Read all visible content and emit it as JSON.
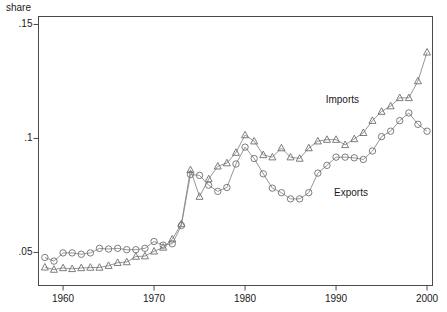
{
  "chart_data": {
    "type": "line",
    "title": "",
    "xlabel": "",
    "ylabel": "share",
    "xlim": [
      1957.3,
      2000.6
    ],
    "ylim": [
      0.0355,
      0.1535
    ],
    "grid": false,
    "legend_position": "inline-annotations",
    "xticks": [
      1960,
      1970,
      1980,
      1990,
      2000
    ],
    "xtick_labels": [
      "1960",
      "1970",
      "1980",
      "1990",
      "2000"
    ],
    "yticks": [
      0.05,
      0.1,
      0.15
    ],
    "ytick_labels": [
      ".05",
      ".1",
      ".15"
    ],
    "x": [
      1958,
      1959,
      1960,
      1961,
      1962,
      1963,
      1964,
      1965,
      1966,
      1967,
      1968,
      1969,
      1970,
      1971,
      1972,
      1973,
      1974,
      1975,
      1976,
      1977,
      1978,
      1979,
      1980,
      1981,
      1982,
      1983,
      1984,
      1985,
      1986,
      1987,
      1988,
      1989,
      1990,
      1991,
      1992,
      1993,
      1994,
      1995,
      1996,
      1997,
      1998,
      1999,
      2000
    ],
    "series": [
      {
        "name": "Imports",
        "marker": "triangle",
        "values": [
          0.0435,
          0.0425,
          0.0432,
          0.0428,
          0.0432,
          0.0434,
          0.0434,
          0.0442,
          0.0455,
          0.0458,
          0.0482,
          0.0484,
          0.0505,
          0.0522,
          0.0558,
          0.0625,
          0.0862,
          0.0745,
          0.0822,
          0.0878,
          0.0892,
          0.0938,
          0.1015,
          0.0988,
          0.0928,
          0.0918,
          0.0958,
          0.0918,
          0.0912,
          0.0958,
          0.0988,
          0.0995,
          0.0995,
          0.0972,
          0.0998,
          0.1025,
          0.1078,
          0.1118,
          0.1142,
          0.1178,
          0.1178,
          0.1252,
          0.1378
        ]
      },
      {
        "name": "Exports",
        "marker": "circle",
        "values": [
          0.0478,
          0.0462,
          0.0498,
          0.0498,
          0.0492,
          0.0498,
          0.0518,
          0.0515,
          0.0518,
          0.0512,
          0.0512,
          0.0518,
          0.0548,
          0.0532,
          0.0538,
          0.0618,
          0.0842,
          0.0838,
          0.0795,
          0.0768,
          0.0785,
          0.0888,
          0.0962,
          0.0912,
          0.0845,
          0.0782,
          0.0762,
          0.0735,
          0.0735,
          0.0762,
          0.0848,
          0.0882,
          0.0918,
          0.0918,
          0.0915,
          0.0908,
          0.0945,
          0.1008,
          0.1032,
          0.1078,
          0.1112,
          0.1062,
          0.1032
        ]
      }
    ],
    "annotations": [
      {
        "text": "Imports",
        "x": 1991.5,
        "y": 0.1165
      },
      {
        "text": "Exports",
        "x": 1992.2,
        "y": 0.0755
      }
    ],
    "colors": {
      "line": "#8a8a8a",
      "marker_stroke": "#6e6e6e",
      "axis": "#4a4a4a",
      "text": "#1a1a1a",
      "background": "#ffffff"
    }
  }
}
